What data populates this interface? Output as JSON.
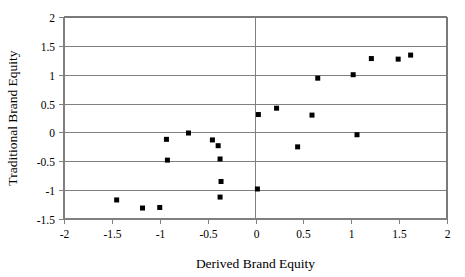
{
  "chart_data": {
    "type": "scatter",
    "title": "",
    "xlabel": "Derived Brand Equity",
    "ylabel": "Traditional Brand Equity",
    "xlim": [
      -2,
      2
    ],
    "ylim": [
      -1.5,
      2
    ],
    "xticks": [
      -2,
      -1.5,
      -1,
      -0.5,
      0,
      0.5,
      1,
      1.5,
      2
    ],
    "xtick_labels": [
      "-2",
      "-1.5",
      "-1",
      "-0.5",
      "0",
      "0.5",
      "1",
      "1.5",
      "2"
    ],
    "yticks": [
      -1.5,
      -1,
      -0.5,
      0,
      0.5,
      1,
      1.5,
      2
    ],
    "ytick_labels": [
      "-1.5",
      "-1",
      "-0.5",
      "0",
      "0.5",
      "1",
      "1.5",
      "2"
    ],
    "grid": "horizontal",
    "legend": "none",
    "marker_color": "#000000",
    "marker_shape": "square",
    "zero_line_vertical": true,
    "points": [
      {
        "x": -1.45,
        "y": -1.17
      },
      {
        "x": -1.18,
        "y": -1.31
      },
      {
        "x": -1.0,
        "y": -1.3
      },
      {
        "x": -0.93,
        "y": -0.12
      },
      {
        "x": -0.92,
        "y": -0.48
      },
      {
        "x": -0.7,
        "y": -0.01
      },
      {
        "x": -0.45,
        "y": -0.13
      },
      {
        "x": -0.39,
        "y": -0.23
      },
      {
        "x": -0.37,
        "y": -0.46
      },
      {
        "x": -0.36,
        "y": -0.85
      },
      {
        "x": -0.37,
        "y": -1.12
      },
      {
        "x": 0.02,
        "y": -0.98
      },
      {
        "x": 0.03,
        "y": 0.31
      },
      {
        "x": 0.22,
        "y": 0.42
      },
      {
        "x": 0.44,
        "y": -0.25
      },
      {
        "x": 0.59,
        "y": 0.3
      },
      {
        "x": 0.65,
        "y": 0.94
      },
      {
        "x": 1.02,
        "y": 1.0
      },
      {
        "x": 1.06,
        "y": -0.04
      },
      {
        "x": 1.21,
        "y": 1.28
      },
      {
        "x": 1.49,
        "y": 1.27
      },
      {
        "x": 1.62,
        "y": 1.34
      }
    ]
  }
}
